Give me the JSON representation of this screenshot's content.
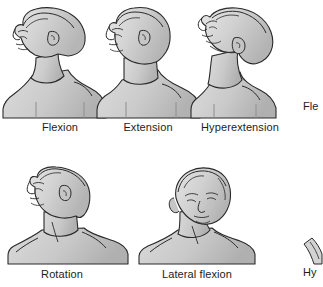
{
  "plate": {
    "title": "Neck range of motion",
    "background_color": "#ffffff",
    "ink_color": "#1c1c1c",
    "skin_fill": "#cfcfcf",
    "skin_fill_light": "#dedede",
    "skin_shadow": "#b5b5b5"
  },
  "rows": [
    {
      "row_index": 1,
      "figures": [
        {
          "id": "flexion",
          "label": "Flexion",
          "view": "left-facing profile, head bent forward, chin toward chest",
          "label_center_x": 60,
          "label_y": 121
        },
        {
          "id": "extension",
          "label": "Extension",
          "view": "left-facing profile, head upright neutral",
          "label_center_x": 148,
          "label_y": 121
        },
        {
          "id": "hyperextension",
          "label": "Hyperextension",
          "view": "left-facing profile, head tilted back, chin raised",
          "label_center_x": 240,
          "label_y": 121
        }
      ]
    },
    {
      "row_index": 2,
      "figures": [
        {
          "id": "rotation",
          "label": "Rotation",
          "view": "head turned to the side, shoulders facing front",
          "label_center_x": 62,
          "label_y": 268
        },
        {
          "id": "lateral-flexion",
          "label": "Lateral flexion",
          "view": "front-facing head tilted toward shoulder",
          "label_center_x": 197,
          "label_y": 268
        }
      ]
    }
  ],
  "cropped_edge_elements": [
    {
      "id": "flexion-partial",
      "label": "Fle",
      "full_label_implied": "Flexion",
      "x": 303,
      "y": 100,
      "note": "caption of an adjacent figure cut off by the right page edge"
    },
    {
      "id": "hyperextension-partial",
      "label": "Hy",
      "full_label_implied": "Hyperextension",
      "x": 303,
      "y": 266,
      "note": "caption of an adjacent figure cut off by the right page edge"
    }
  ]
}
